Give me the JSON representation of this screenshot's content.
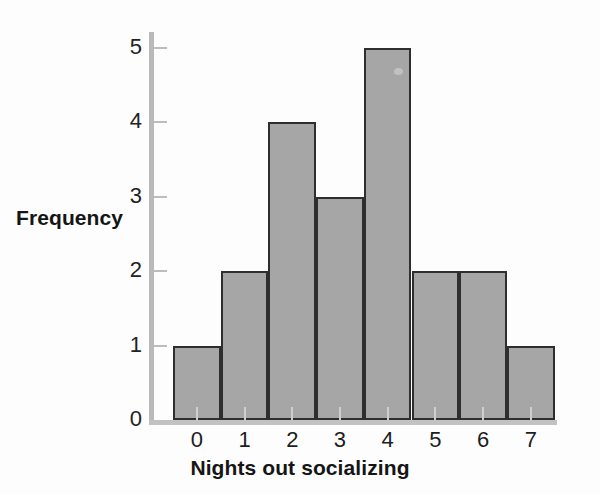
{
  "chart_data": {
    "type": "bar",
    "title": "",
    "xlabel": "Nights out socializing",
    "ylabel": "Frequency",
    "categories": [
      "0",
      "1",
      "2",
      "3",
      "4",
      "5",
      "6",
      "7"
    ],
    "values": [
      1,
      2,
      4,
      3,
      5,
      2,
      2,
      1
    ],
    "ylim": [
      0,
      5
    ],
    "yticks": [
      "0",
      "1",
      "2",
      "3",
      "4",
      "5"
    ],
    "ytick_values": [
      0,
      1,
      2,
      3,
      4,
      5
    ],
    "grid": false,
    "legend": null,
    "bar_fill_color": "#a6a6a6",
    "bar_edge_color": "#2e2e2e",
    "axis_color": "#bdbdbd",
    "background_color": "#fdfdfd"
  }
}
